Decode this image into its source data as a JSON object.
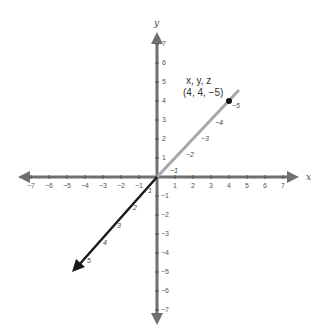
{
  "diagram": {
    "axes": {
      "x_label": "x",
      "y_label": "y",
      "x_ticks": [
        "−7",
        "−6",
        "−5",
        "−4",
        "−3",
        "−2",
        "−1",
        "1",
        "2",
        "3",
        "4",
        "5",
        "6",
        "7"
      ],
      "y_ticks_pos": [
        "1",
        "2",
        "3",
        "4",
        "5",
        "6",
        "7"
      ],
      "y_ticks_neg": [
        "−1",
        "−2",
        "−3",
        "−4",
        "−5",
        "−6",
        "−7"
      ],
      "z_ticks_pos": [
        "1",
        "2",
        "3",
        "4",
        "5"
      ],
      "z_ticks_neg": [
        "−1",
        "−2",
        "−3",
        "−4",
        "−5"
      ]
    },
    "point": {
      "header": "x, y,  z",
      "coords": "(4, 4, −5)"
    },
    "colors": {
      "axis": "#707070",
      "z_positive": "#1a1a1a",
      "z_negative": "#a8a8a8",
      "point": "#111111"
    }
  }
}
